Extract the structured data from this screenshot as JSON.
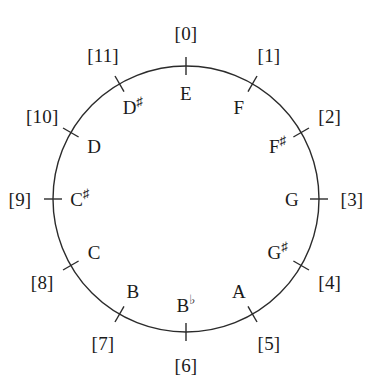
{
  "figure": {
    "type": "pitch-class-circle",
    "title": "",
    "background_color": "#ffffff",
    "stroke_color": "#2b2b2b",
    "circle": {
      "cx": 186,
      "cy": 199,
      "r": 133,
      "stroke_width": 1.4
    },
    "tick": {
      "inner_offset": 9,
      "outer_offset": 9,
      "stroke_width": 1.4
    }
  },
  "nodes": [
    {
      "index": "[0]",
      "note": "E",
      "accidental": "",
      "angle_deg": -90,
      "note_radius": 106,
      "index_radius": 166
    },
    {
      "index": "[1]",
      "note": "F",
      "accidental": "",
      "angle_deg": -60,
      "note_radius": 106,
      "index_radius": 166
    },
    {
      "index": "[2]",
      "note": "F",
      "accidental": "♯",
      "angle_deg": -30,
      "note_radius": 106,
      "index_radius": 166
    },
    {
      "index": "[3]",
      "note": "G",
      "accidental": "",
      "angle_deg": 0,
      "note_radius": 106,
      "index_radius": 166
    },
    {
      "index": "[4]",
      "note": "G",
      "accidental": "♯",
      "angle_deg": 30,
      "note_radius": 106,
      "index_radius": 166
    },
    {
      "index": "[5]",
      "note": "A",
      "accidental": "",
      "angle_deg": 60,
      "note_radius": 106,
      "index_radius": 166
    },
    {
      "index": "[6]",
      "note": "B",
      "accidental": "♭",
      "angle_deg": 90,
      "note_radius": 106,
      "index_radius": 166
    },
    {
      "index": "[7]",
      "note": "B",
      "accidental": "",
      "angle_deg": 120,
      "note_radius": 106,
      "index_radius": 166
    },
    {
      "index": "[8]",
      "note": "C",
      "accidental": "",
      "angle_deg": 150,
      "note_radius": 106,
      "index_radius": 166
    },
    {
      "index": "[9]",
      "note": "C",
      "accidental": "♯",
      "angle_deg": 180,
      "note_radius": 106,
      "index_radius": 166
    },
    {
      "index": "[10]",
      "note": "D",
      "accidental": "",
      "angle_deg": 210,
      "note_radius": 106,
      "index_radius": 166
    },
    {
      "index": "[11]",
      "note": "D",
      "accidental": "♯",
      "angle_deg": 240,
      "note_radius": 106,
      "index_radius": 166
    }
  ]
}
